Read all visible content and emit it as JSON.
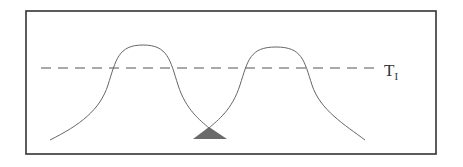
{
  "diagram": {
    "threshold_label": "T",
    "threshold_subscript": "I",
    "colors": {
      "frame": "#333333",
      "curve": "#666666",
      "dashed_line": "#555555",
      "triangle_fill": "#6a6a6a"
    },
    "elements": [
      {
        "type": "frame",
        "description": "rectangular border"
      },
      {
        "type": "curve",
        "description": "left bell-shaped peak"
      },
      {
        "type": "curve",
        "description": "right bell-shaped peak"
      },
      {
        "type": "dashed-line",
        "description": "horizontal threshold line T_I"
      },
      {
        "type": "triangle",
        "description": "filled triangle marker at curve intersection"
      }
    ]
  }
}
